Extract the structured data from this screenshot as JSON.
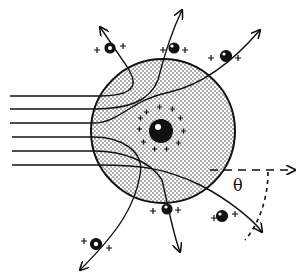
{
  "diagram": {
    "angle_label": "θ",
    "colors": {
      "ink": "#111111",
      "atom_fill": "#ffffff",
      "background": "#ffffff"
    },
    "incoming_beam_count": 6,
    "particle_charge_symbol": "+",
    "scattered_particle_count": 5,
    "nucleus_charge_symbol": "+"
  }
}
